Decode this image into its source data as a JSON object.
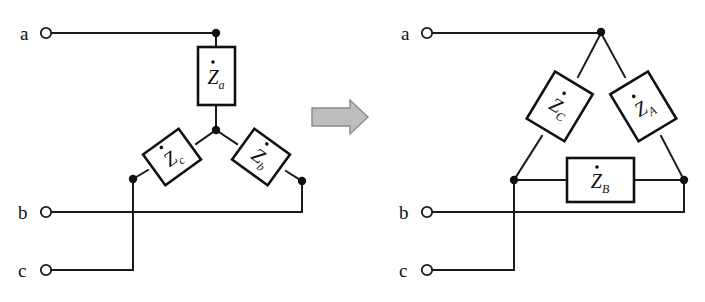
{
  "figure": {
    "background_color": "#ffffff",
    "line_color": "#1a1a1a",
    "arrow_fill": "#bdbdbd",
    "arrow_stroke": "#8a8a8a"
  },
  "left_circuit": {
    "name": "wye-connection",
    "terminals": [
      {
        "id": "a",
        "label": "a",
        "cx": 46,
        "cy": 33
      },
      {
        "id": "b",
        "label": "b",
        "cx": 46,
        "cy": 212
      },
      {
        "id": "c",
        "label": "c",
        "cx": 46,
        "cy": 270
      }
    ],
    "impedances": [
      {
        "id": "Za",
        "symbol": "Z",
        "subscript": "a",
        "overdot": "̇",
        "orientation": "vertical",
        "cx": 216,
        "cy": 76,
        "rotation": 0
      },
      {
        "id": "Zc",
        "symbol": "Z",
        "subscript": "c",
        "overdot": "̇",
        "orientation": "diagonal",
        "cx": 172,
        "cy": 157,
        "rotation": -36
      },
      {
        "id": "Zb",
        "symbol": "Z",
        "subscript": "b",
        "overdot": "̇",
        "orientation": "diagonal",
        "cx": 261,
        "cy": 157,
        "rotation": 36
      }
    ],
    "nodes": [
      {
        "id": "star-center",
        "cx": 216,
        "cy": 130
      },
      {
        "id": "a-top",
        "cx": 216,
        "cy": 33
      },
      {
        "id": "c-left",
        "cx": 133,
        "cy": 179
      },
      {
        "id": "b-right",
        "cx": 302,
        "cy": 181
      }
    ]
  },
  "arrow": {
    "name": "transform-arrow",
    "direction": "right",
    "x": 312,
    "y": 100,
    "width": 56,
    "height": 34
  },
  "right_circuit": {
    "name": "delta-connection",
    "terminals": [
      {
        "id": "a",
        "label": "a",
        "cx": 427,
        "cy": 33
      },
      {
        "id": "b",
        "label": "b",
        "cx": 427,
        "cy": 212
      },
      {
        "id": "c",
        "label": "c",
        "cx": 427,
        "cy": 270
      }
    ],
    "impedances": [
      {
        "id": "ZC",
        "symbol": "Z",
        "subscript": "C",
        "overdot": "̇",
        "orientation": "diagonal",
        "cx": 560,
        "cy": 106,
        "rotation": 31
      },
      {
        "id": "ZA",
        "symbol": "Z",
        "subscript": "A",
        "overdot": "̇",
        "orientation": "diagonal",
        "cx": 643,
        "cy": 106,
        "rotation": -31
      },
      {
        "id": "ZB",
        "symbol": "Z",
        "subscript": "B",
        "overdot": "̇",
        "orientation": "horizontal",
        "cx": 600,
        "cy": 180,
        "rotation": 0
      }
    ],
    "nodes": [
      {
        "id": "apex-a",
        "cx": 601,
        "cy": 32
      },
      {
        "id": "corner-c",
        "cx": 514,
        "cy": 180
      },
      {
        "id": "corner-b",
        "cx": 684,
        "cy": 180
      }
    ]
  }
}
